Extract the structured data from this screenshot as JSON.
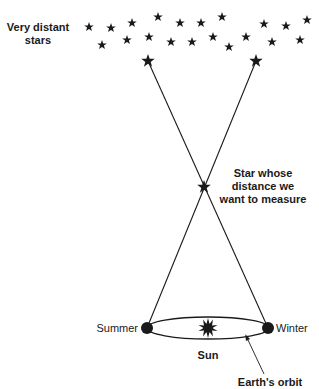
{
  "labels": {
    "distant_stars_line1": "Very distant",
    "distant_stars_line2": "stars",
    "target_star_line1": "Star whose",
    "target_star_line2": "distance we",
    "target_star_line3": "want to measure",
    "summer": "Summer",
    "winter": "Winter",
    "sun": "Sun",
    "earth_orbit": "Earth's orbit"
  },
  "colors": {
    "ink": "#1a1a1a",
    "background": "#ffffff"
  },
  "distant_stars": [
    [
      89,
      27
    ],
    [
      111,
      28
    ],
    [
      132,
      23
    ],
    [
      158,
      17
    ],
    [
      180,
      23
    ],
    [
      201,
      23
    ],
    [
      222,
      17
    ],
    [
      264,
      24
    ],
    [
      286,
      26
    ],
    [
      307,
      20
    ],
    [
      102,
      45
    ],
    [
      127,
      40
    ],
    [
      149,
      37
    ],
    [
      171,
      42
    ],
    [
      192,
      42
    ],
    [
      213,
      37
    ],
    [
      229,
      47
    ],
    [
      246,
      37
    ],
    [
      272,
      42
    ],
    [
      300,
      40
    ]
  ],
  "reference_stars": [
    [
      148,
      61
    ],
    [
      256,
      61
    ]
  ],
  "target_star": [
    204,
    187
  ],
  "earth_positions": {
    "summer": [
      147,
      328
    ],
    "winter": [
      268,
      328
    ]
  },
  "sun_position": [
    208,
    328
  ]
}
